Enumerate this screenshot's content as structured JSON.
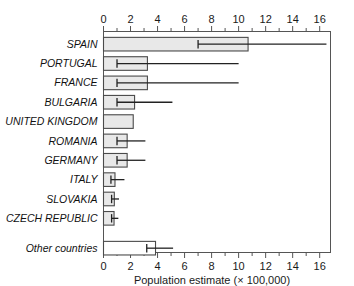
{
  "chart_data": {
    "type": "bar",
    "orientation": "horizontal",
    "title": "",
    "xlabel": "Population estimate (× 100,000)",
    "ylabel": "",
    "xlim": [
      0,
      16.8
    ],
    "xticks": [
      0,
      2,
      4,
      6,
      8,
      10,
      12,
      14,
      16
    ],
    "xtick_labels": [
      "0",
      "2",
      "4",
      "6",
      "8",
      "10",
      "12",
      "14",
      "16"
    ],
    "minor_tick_step": 1,
    "grid": false,
    "legend": null,
    "axis_top": true,
    "axis_bottom": true,
    "categories": [
      "SPAIN",
      "PORTUGAL",
      "FRANCE",
      "BULGARIA",
      "UNITED KINGDOM",
      "ROMANIA",
      "GERMANY",
      "ITALY",
      "SLOVAKIA",
      "CZECH REPUBLIC",
      "Other countries"
    ],
    "values": [
      10.7,
      3.25,
      3.25,
      2.3,
      2.2,
      1.75,
      1.75,
      0.85,
      0.8,
      0.78,
      3.85
    ],
    "error_low": [
      7.0,
      1.0,
      1.0,
      1.0,
      null,
      1.0,
      1.0,
      0.55,
      0.6,
      0.6,
      3.2
    ],
    "error_high": [
      16.5,
      10.0,
      10.0,
      5.1,
      null,
      3.1,
      3.1,
      1.55,
      1.15,
      1.1,
      5.15
    ],
    "bar_fill": "#e8e8e8",
    "bar_fill_last": "#ffffff",
    "bar_edge": "#4a4a4a",
    "whisker_color": "#222222"
  }
}
